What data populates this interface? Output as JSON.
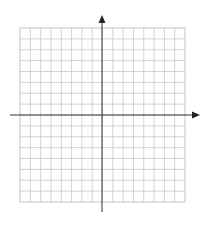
{
  "diagram": {
    "type": "coordinate-grid",
    "grid": {
      "columns": 16,
      "rows": 16,
      "left": 20,
      "top": 28,
      "right": 185,
      "bottom": 202,
      "line_color": "#c8c8c8"
    },
    "axes": {
      "color": "#333333",
      "x_axis": {
        "y": 115,
        "x_start": 10,
        "x_end": 200,
        "arrow": "right"
      },
      "y_axis": {
        "x": 102,
        "y_start": 212,
        "y_end": 15,
        "arrow": "up"
      }
    },
    "labels": []
  }
}
